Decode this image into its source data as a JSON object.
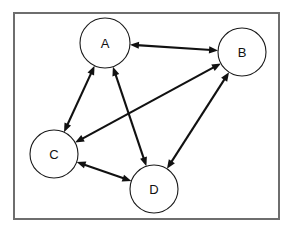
{
  "diagram": {
    "canvas": {
      "width": 292,
      "height": 231,
      "background": "#ffffff"
    },
    "frame": {
      "name": "diagram-border",
      "x": 14,
      "y": 13,
      "width": 265,
      "height": 206,
      "stroke": "#6e6e6e",
      "stroke_width": 2
    },
    "style": {
      "node_fill": "#ffffff",
      "node_stroke": "#1a1a1a",
      "node_stroke_width": 1.1,
      "edge_color": "#111111",
      "edge_width": 2.1,
      "label_color": "#111111",
      "label_font_size": 13
    },
    "nodes": [
      {
        "id": "A",
        "label": "A",
        "cx": 105,
        "cy": 43,
        "r": 25
      },
      {
        "id": "B",
        "label": "B",
        "cx": 242,
        "cy": 52,
        "r": 24
      },
      {
        "id": "C",
        "label": "C",
        "cx": 54,
        "cy": 154,
        "r": 24
      },
      {
        "id": "D",
        "label": "D",
        "cx": 154,
        "cy": 189,
        "r": 24
      }
    ],
    "edges": [
      {
        "id": "A-B",
        "source": "A",
        "target": "B",
        "directed": "both",
        "label": "A ↔ B"
      },
      {
        "id": "A-C",
        "source": "A",
        "target": "C",
        "directed": "both",
        "label": "A ↔ C"
      },
      {
        "id": "A-D",
        "source": "A",
        "target": "D",
        "directed": "both",
        "label": "A ↔ D"
      },
      {
        "id": "B-C",
        "source": "B",
        "target": "C",
        "directed": "both",
        "label": "B ↔ C"
      },
      {
        "id": "B-D",
        "source": "B",
        "target": "D",
        "directed": "both",
        "label": "B ↔ D"
      },
      {
        "id": "C-D",
        "source": "C",
        "target": "D",
        "directed": "both",
        "label": "C ↔ D"
      }
    ],
    "arrowhead": {
      "length": 9,
      "half_width": 3.6
    }
  }
}
